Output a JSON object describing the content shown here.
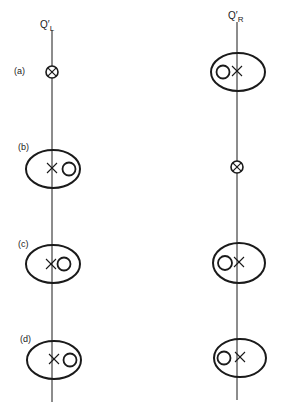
{
  "diagram": {
    "stroke_color": "#1a1a1a",
    "background": "#ffffff",
    "axes": [
      {
        "id": "left",
        "label_main": "Q′",
        "label_sub": "L",
        "x": 52,
        "y_top": 30,
        "y_bottom": 402,
        "label_x": 40,
        "label_y": 20
      },
      {
        "id": "right",
        "label_main": "Q′",
        "label_sub": "R",
        "x": 237,
        "y_top": 22,
        "y_bottom": 400,
        "label_x": 228,
        "label_y": 11
      }
    ],
    "rows": [
      {
        "label": "(a)",
        "label_x": 14,
        "label_y": 67,
        "left": {
          "type": "crossed-circle",
          "cx": 52,
          "cy": 72,
          "r": 6
        },
        "right": {
          "type": "ellipse",
          "cx": 238,
          "cy": 72,
          "rx": 27,
          "ry": 19,
          "circle": {
            "cx": 223,
            "cy": 72,
            "r": 6.5
          },
          "cross": {
            "cx": 237,
            "cy": 71,
            "s": 5
          }
        }
      },
      {
        "label": "(b)",
        "label_x": 18,
        "label_y": 143,
        "left": {
          "type": "ellipse",
          "cx": 53,
          "cy": 169,
          "rx": 27,
          "ry": 19,
          "circle": {
            "cx": 69,
            "cy": 169,
            "r": 6.5
          },
          "cross": {
            "cx": 52,
            "cy": 168,
            "s": 5
          }
        },
        "right": {
          "type": "crossed-circle",
          "cx": 237,
          "cy": 167,
          "r": 6
        }
      },
      {
        "label": "(c)",
        "label_x": 18,
        "label_y": 240,
        "left": {
          "type": "ellipse",
          "cx": 53,
          "cy": 264,
          "rx": 27,
          "ry": 19,
          "circle": {
            "cx": 64,
            "cy": 264,
            "r": 6.5
          },
          "cross": {
            "cx": 51,
            "cy": 264,
            "s": 5
          }
        },
        "right": {
          "type": "ellipse",
          "cx": 239,
          "cy": 263,
          "rx": 26,
          "ry": 20,
          "circle": {
            "cx": 225,
            "cy": 263,
            "r": 7
          },
          "cross": {
            "cx": 239,
            "cy": 262,
            "s": 5
          }
        }
      },
      {
        "label": "(d)",
        "label_x": 20,
        "label_y": 335,
        "left": {
          "type": "ellipse",
          "cx": 54,
          "cy": 360,
          "rx": 27,
          "ry": 19,
          "circle": {
            "cx": 70,
            "cy": 360,
            "r": 6.5
          },
          "cross": {
            "cx": 54,
            "cy": 359,
            "s": 5
          }
        },
        "right": {
          "type": "ellipse",
          "cx": 240,
          "cy": 358,
          "rx": 26,
          "ry": 19,
          "circle": {
            "cx": 224,
            "cy": 358,
            "r": 6.5
          },
          "cross": {
            "cx": 240,
            "cy": 357,
            "s": 5
          }
        }
      }
    ]
  }
}
